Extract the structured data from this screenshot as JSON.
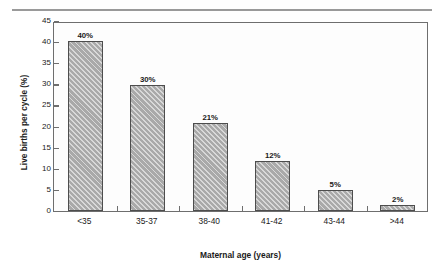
{
  "figure": {
    "top_rule": "",
    "background_color": "#ffffff"
  },
  "chart_data": {
    "type": "bar",
    "title": "",
    "subtitle": "",
    "xlabel": "Maternal age (years)",
    "ylabel": "Live births per cycle (%)",
    "categories": [
      "<35",
      "35-37",
      "38-40",
      "41-42",
      "43-44",
      ">44"
    ],
    "values": [
      40,
      30,
      21,
      12,
      5,
      2
    ],
    "bar_heights": [
      40.3,
      29.9,
      20.9,
      11.8,
      4.9,
      1.5
    ],
    "data_labels": [
      "40%",
      "30%",
      "21%",
      "12%",
      "5%",
      "2%"
    ],
    "ylim": [
      0,
      45
    ],
    "ytick_values": [
      0,
      5,
      10,
      15,
      20,
      25,
      30,
      35,
      40,
      45
    ],
    "ytick_labels": [
      "0",
      "5",
      "10",
      "15",
      "20",
      "25",
      "30",
      "35",
      "40",
      "45"
    ],
    "grid": false,
    "legend": null,
    "legend_position": "none",
    "bar_fill_color": "#a9a9a9",
    "bar_edge_color": "#4d4d4d",
    "bar_hatch": "diagonal",
    "axis_color": "#6e6e6e",
    "plot_background": "#fdfdfd"
  }
}
